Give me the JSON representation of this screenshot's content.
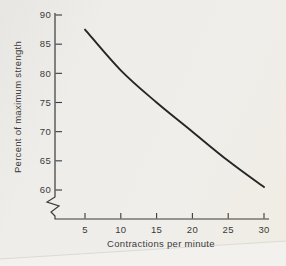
{
  "figure": {
    "paper_color": "#edebe6",
    "ink_color": "#3a3a3a",
    "curve_color": "#262626",
    "artifact_line_color": "#dcdad4",
    "artifact_fill_color": "#f3f1ed"
  },
  "chart_data": {
    "type": "line",
    "title": "",
    "xlabel": "Contractions per minute",
    "ylabel": "Percent of maximum strength",
    "x": [
      5,
      10,
      15,
      20,
      25,
      30
    ],
    "values": [
      87.5,
      80.5,
      75,
      70,
      65,
      60.5
    ],
    "xticks": [
      5,
      10,
      15,
      20,
      25,
      30
    ],
    "yticks": [
      90,
      85,
      80,
      75,
      70,
      65,
      60
    ],
    "xlim": [
      5,
      30
    ],
    "ylim": [
      60,
      90
    ],
    "y_axis_break": true,
    "grid": false,
    "legend": false
  }
}
